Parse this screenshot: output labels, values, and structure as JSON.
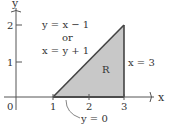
{
  "diagram": {
    "axes": {
      "x_label": "x",
      "y_label": "y",
      "origin_label": "0",
      "x_ticks": [
        "1",
        "2",
        "3"
      ],
      "y_ticks": [
        "1",
        "2"
      ]
    },
    "region_label": "R",
    "equations": {
      "hypotenuse_line1": "y = x − 1",
      "hypotenuse_or": "or",
      "hypotenuse_line2": "x = y + 1",
      "right_edge": "x = 3",
      "bottom_edge": "y = 0"
    },
    "colors": {
      "region_fill": "#c8c8c8",
      "lines": "#444444"
    }
  }
}
